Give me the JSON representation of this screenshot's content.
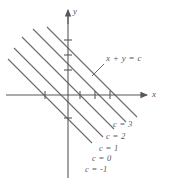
{
  "figure": {
    "name": "level-curves-diagram",
    "background": "#ffffff",
    "line_color": "#6b6b6d",
    "axis_color": "#58585a",
    "text_color": "#58585a",
    "width": 172,
    "height": 184
  },
  "axes": {
    "x_label": "x",
    "y_label": "y",
    "origin": {
      "x": 68,
      "y": 95
    },
    "x_start": {
      "x": 6,
      "y": 95
    },
    "x_end": {
      "x": 147,
      "y": 95
    },
    "y_start": {
      "x": 68,
      "y": 10
    },
    "y_end": {
      "x": 68,
      "y": 178
    },
    "x_ticks": [
      45,
      80,
      95,
      110
    ],
    "y_ticks": [
      40,
      55,
      70,
      118
    ]
  },
  "annotation": {
    "equation_label": "x + y = c",
    "equation_pos": {
      "x": 106,
      "y": 59
    },
    "leader_from": {
      "x": 104,
      "y": 64
    },
    "leader_to": {
      "x": 92,
      "y": 76
    }
  },
  "chart_data": {
    "type": "line",
    "title": "",
    "xlabel": "x",
    "ylabel": "y",
    "legend": "none",
    "grid": false,
    "slope": -1,
    "family_equation": "x + y = c",
    "levels": [
      {
        "label": "c = 3",
        "c": 3,
        "x1": 47,
        "y1": 27,
        "x2": 137,
        "y2": 117
      },
      {
        "label": "c = 2",
        "c": 2,
        "x1": 33,
        "y1": 29,
        "x2": 126,
        "y2": 122
      },
      {
        "label": "c = 1",
        "c": 1,
        "x1": 22,
        "y1": 37,
        "x2": 114,
        "y2": 129
      },
      {
        "label": "c = 0",
        "c": 0,
        "x1": 14,
        "y1": 48,
        "x2": 103,
        "y2": 137
      },
      {
        "label": "c = -1",
        "c": -1,
        "x1": 8,
        "y1": 59,
        "x2": 92,
        "y2": 143
      }
    ],
    "level_labels": [
      {
        "text": "c = 3",
        "x": 113,
        "y": 119
      },
      {
        "text": "c = 2",
        "x": 106,
        "y": 131
      },
      {
        "text": "c = 1",
        "x": 99,
        "y": 143
      },
      {
        "text": "c = 0",
        "x": 92,
        "y": 153
      },
      {
        "text": "c = -1",
        "x": 85,
        "y": 164
      }
    ]
  }
}
